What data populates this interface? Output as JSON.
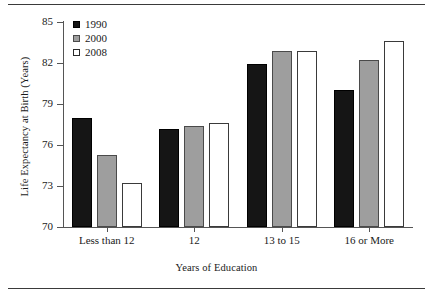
{
  "chart_data": {
    "type": "bar",
    "title": "",
    "xlabel": "Years of Education",
    "ylabel": "Life Expectancy at Birth (Years)",
    "categories": [
      "Less than 12",
      "12",
      "13 to 15",
      "16 or More"
    ],
    "series": [
      {
        "name": "1990",
        "color": "#151515",
        "values": [
          78.0,
          77.2,
          81.9,
          80.0
        ]
      },
      {
        "name": "2000",
        "color": "#9e9e9e",
        "values": [
          75.3,
          77.4,
          82.9,
          82.2
        ]
      },
      {
        "name": "2008",
        "color": "#ffffff",
        "values": [
          73.2,
          77.6,
          82.9,
          83.6
        ]
      }
    ],
    "ylim": [
      70,
      85
    ],
    "yticks": [
      70,
      73,
      76,
      79,
      82,
      85
    ],
    "ytick_labels": [
      "70",
      "73",
      "76",
      "79",
      "82",
      "85"
    ],
    "grid": false,
    "legend_position": "top-left"
  },
  "legend": {
    "entries": [
      {
        "label": "1990",
        "swatch": "filled-black-square"
      },
      {
        "label": "2000",
        "swatch": "filled-gray-square"
      },
      {
        "label": "2008",
        "swatch": "open-white-square"
      }
    ]
  },
  "axes": {
    "y_title": "Life Expectancy at Birth (Years)",
    "x_title": "Years of Education"
  }
}
